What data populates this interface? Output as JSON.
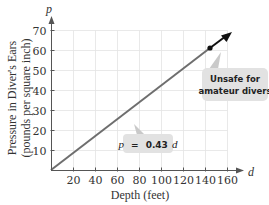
{
  "chart_data": {
    "type": "line",
    "title": "",
    "xlabel": "Depth (feet)",
    "ylabel_line1": "Pressure in Diver's Ears",
    "ylabel_line2": "(pounds per square inch)",
    "x_var": "d",
    "y_var": "p",
    "xlim": [
      0,
      160
    ],
    "ylim": [
      0,
      70
    ],
    "x_ticks": [
      20,
      40,
      60,
      80,
      100,
      120,
      140,
      160
    ],
    "y_ticks": [
      10,
      20,
      30,
      40,
      50,
      60,
      70
    ],
    "grid": true,
    "series": [
      {
        "name": "p = 0.43d",
        "equation": "p = 0.43d",
        "slope": 0.43,
        "x": [
          0,
          40,
          80,
          120,
          143,
          160
        ],
        "y": [
          0,
          17.2,
          34.4,
          51.6,
          61.5,
          68.8
        ],
        "color": "#6e6e6e",
        "unsafe_segment_color": "#111111"
      }
    ],
    "highlight_point": {
      "x": 143,
      "y": 61.5
    },
    "annotations": [
      {
        "text": "p = 0.43d",
        "var": "p",
        "eq": "=",
        "coef": "0.43",
        "xvar": "d"
      },
      {
        "line1": "Unsafe for",
        "line2": "amateur divers"
      }
    ]
  },
  "colors": {
    "axis": "#555555",
    "grid": "#e3e3e3",
    "line": "#6e6e6e",
    "arrow": "#111111",
    "callout_bg": "#e2e2e2",
    "callout_pointer": "#c9c9c9"
  }
}
